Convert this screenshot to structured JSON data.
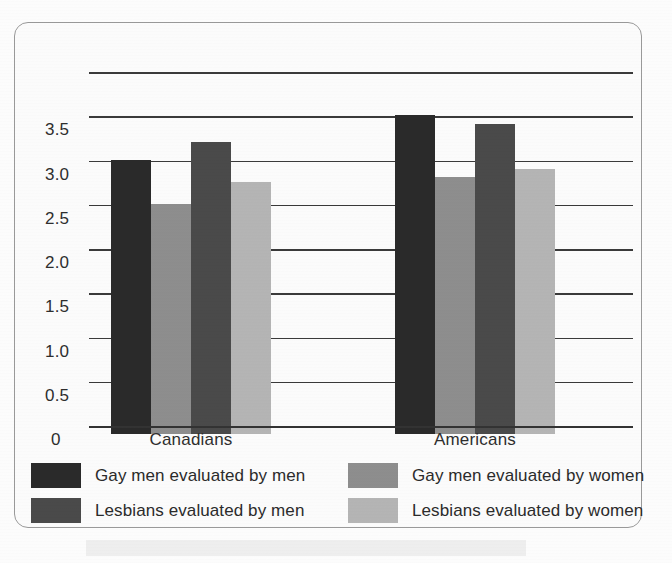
{
  "chart_data": {
    "type": "bar",
    "title": "",
    "subtitle": "",
    "xlabel": "",
    "ylabel": "",
    "categories": [
      "Canadians",
      "Americans"
    ],
    "series": [
      {
        "name": "Gay men evaluated by men",
        "color": "#2a2a2a",
        "values": [
          3.1,
          3.6
        ]
      },
      {
        "name": "Gay men evaluated by women",
        "color": "#8e8e8e",
        "values": [
          2.6,
          2.9
        ]
      },
      {
        "name": "Lesbians evaluated by men",
        "color": "#4a4a4a",
        "values": [
          3.3,
          3.5
        ]
      },
      {
        "name": "Lesbians evaluated by women",
        "color": "#b5b5b5",
        "values": [
          2.85,
          3.0
        ]
      }
    ],
    "ylim": [
      0,
      4.0
    ],
    "ytick_values": [
      4.0,
      3.5,
      3.0,
      2.5,
      2.0,
      1.5,
      1.0,
      0.5,
      0
    ],
    "ytick_labels": [
      "",
      "3.5",
      "3.0",
      "2.5",
      "2.0",
      "1.5",
      "1.0",
      "0.5",
      "0"
    ],
    "grid": true,
    "grid_axis": "y",
    "legend_position": "bottom",
    "legend_columns": 2,
    "bar_gap_within_group": 0,
    "frame": "rounded-rectangle"
  },
  "axis": {
    "zero_label": "0",
    "ticks": [
      "3.5",
      "3.0",
      "2.5",
      "2.0",
      "1.5",
      "1.0",
      "0.5"
    ]
  },
  "categories": {
    "first": "Canadians",
    "second": "Americans"
  },
  "legend": {
    "items": [
      {
        "label": "Gay men evaluated by men",
        "color": "#2a2a2a"
      },
      {
        "label": "Gay men evaluated by women",
        "color": "#8e8e8e"
      },
      {
        "label": "Lesbians evaluated by men",
        "color": "#4a4a4a"
      },
      {
        "label": "Lesbians evaluated by women",
        "color": "#b5b5b5"
      }
    ]
  }
}
